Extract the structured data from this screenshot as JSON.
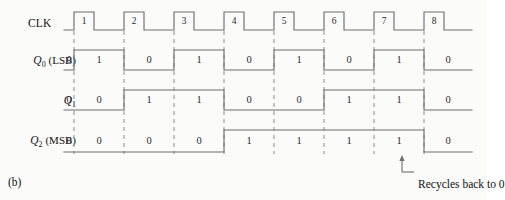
{
  "figure": {
    "panel_letter": "(b)",
    "annotation": "Recycles back to 0",
    "stroke_color": "#6e6e6e",
    "dash_color": "#8a8a8a",
    "text_color": "#2a2a2a",
    "background": "#fbfbfa"
  },
  "clock": {
    "label": "CLK",
    "pulse_numbers": [
      "1",
      "2",
      "3",
      "4",
      "5",
      "6",
      "7",
      "8"
    ],
    "pulse_count": 8
  },
  "signals": [
    {
      "id": "q0",
      "symbol": "Q",
      "subscript": "0",
      "qualifier": "(LSB)",
      "label_text": "Q0 (LSB)",
      "values": [
        "0",
        "1",
        "0",
        "1",
        "0",
        "1",
        "0",
        "1",
        "0"
      ]
    },
    {
      "id": "q1",
      "symbol": "Q",
      "subscript": "1",
      "qualifier": "",
      "label_text": "Q1",
      "values": [
        "0",
        "0",
        "1",
        "1",
        "0",
        "0",
        "1",
        "1",
        "0"
      ]
    },
    {
      "id": "q2",
      "symbol": "Q",
      "subscript": "2",
      "qualifier": "(MSB)",
      "label_text": "Q2 (MSB)",
      "values": [
        "0",
        "0",
        "0",
        "0",
        "1",
        "1",
        "1",
        "1",
        "0"
      ]
    }
  ],
  "chart_data": {
    "type": "line",
    "xlabel": "Clock pulse",
    "ylabel": "Logic level",
    "x": [
      0,
      1,
      2,
      3,
      4,
      5,
      6,
      7,
      8
    ],
    "grid": false,
    "legend": "none",
    "series": [
      {
        "name": "CLK",
        "values": [
          0,
          1,
          1,
          1,
          1,
          1,
          1,
          1,
          1
        ]
      },
      {
        "name": "Q0 (LSB)",
        "values": [
          0,
          1,
          0,
          1,
          0,
          1,
          0,
          1,
          0
        ]
      },
      {
        "name": "Q1",
        "values": [
          0,
          0,
          1,
          1,
          0,
          0,
          1,
          1,
          0
        ]
      },
      {
        "name": "Q2 (MSB)",
        "values": [
          0,
          0,
          0,
          0,
          1,
          1,
          1,
          1,
          0
        ]
      }
    ],
    "annotations": [
      "Recycles back to 0"
    ]
  }
}
